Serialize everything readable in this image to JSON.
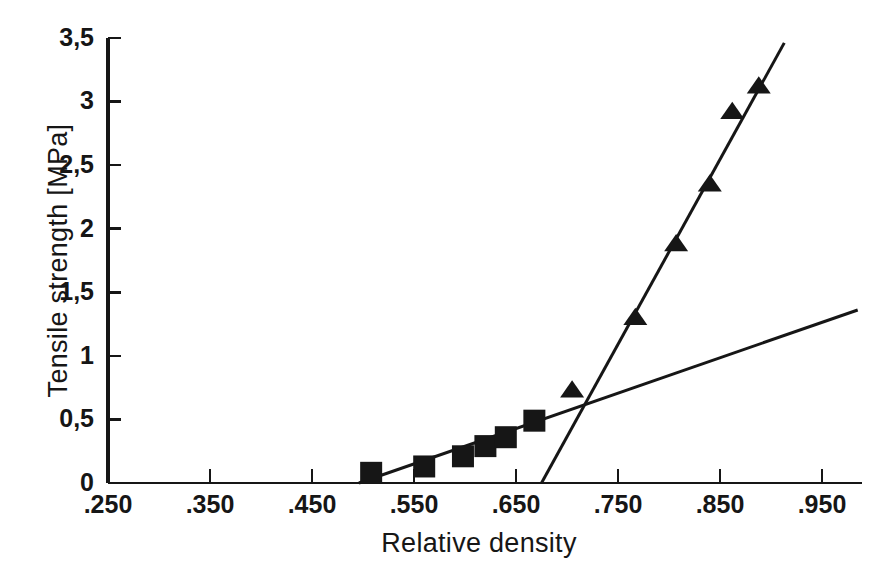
{
  "chart_data": {
    "type": "scatter",
    "title": "",
    "xlabel": "Relative density",
    "ylabel": "Tensile strength [MPa]",
    "xlim": [
      0.25,
      0.985
    ],
    "ylim": [
      0,
      3.5
    ],
    "grid": false,
    "legend": "none",
    "xticks": [
      0.25,
      0.35,
      0.45,
      0.55,
      0.65,
      0.75,
      0.85,
      0.95
    ],
    "xtick_labels": [
      ".250",
      ".350",
      ".450",
      ".550",
      ".650",
      ".750",
      ".850",
      ".950"
    ],
    "yticks": [
      0,
      0.5,
      1,
      1.5,
      2,
      2.5,
      3,
      3.5
    ],
    "ytick_labels": [
      "0",
      "0,5",
      "1",
      "1,5",
      "2",
      "2,5",
      "3",
      "3,5"
    ],
    "series": [
      {
        "name": "low-density-series",
        "marker": "square",
        "color": "#161616",
        "points": [
          {
            "x": 0.508,
            "y": 0.08
          },
          {
            "x": 0.56,
            "y": 0.13
          },
          {
            "x": 0.598,
            "y": 0.21
          },
          {
            "x": 0.62,
            "y": 0.29
          },
          {
            "x": 0.64,
            "y": 0.36
          },
          {
            "x": 0.668,
            "y": 0.49
          }
        ]
      },
      {
        "name": "high-density-series",
        "marker": "triangle",
        "color": "#161616",
        "points": [
          {
            "x": 0.705,
            "y": 0.73
          },
          {
            "x": 0.767,
            "y": 1.3
          },
          {
            "x": 0.807,
            "y": 1.88
          },
          {
            "x": 0.84,
            "y": 2.35
          },
          {
            "x": 0.862,
            "y": 2.92
          },
          {
            "x": 0.888,
            "y": 3.12
          }
        ]
      }
    ],
    "fit_lines": [
      {
        "name": "shallow-fit-line",
        "color": "#161616",
        "x0": 0.496,
        "y0": 0.0,
        "x1": 0.985,
        "y1": 1.36
      },
      {
        "name": "steep-fit-line",
        "color": "#161616",
        "x0": 0.675,
        "y0": 0.0,
        "x1": 0.913,
        "y1": 3.46
      }
    ]
  }
}
